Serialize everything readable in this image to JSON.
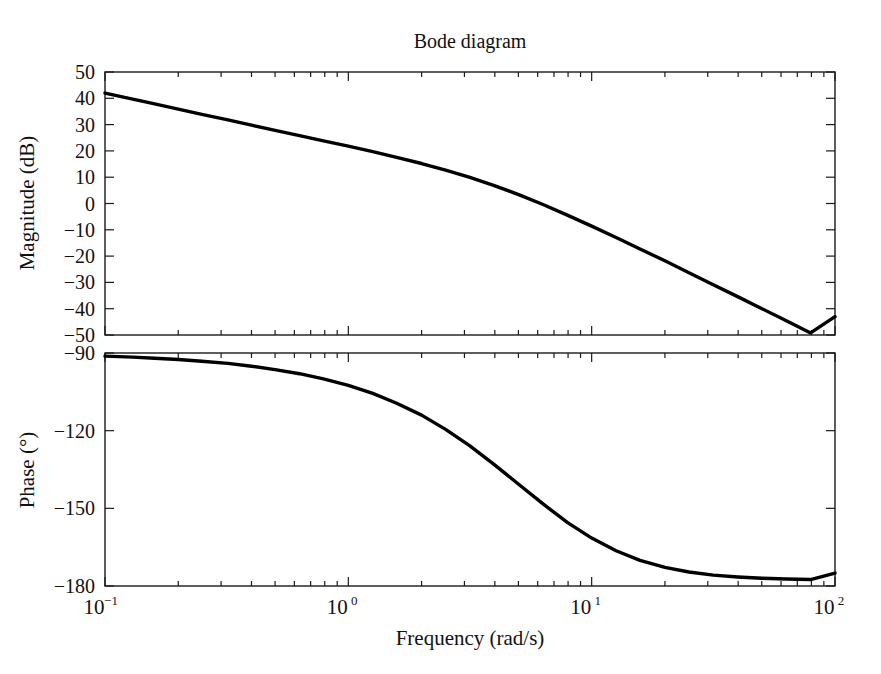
{
  "figure": {
    "title": "Bode diagram",
    "background_color": "#ffffff",
    "curve_color": "#000000",
    "axis_color": "#1a1a1a"
  },
  "xaxis": {
    "label": "Frequency (rad/s)",
    "scale": "log",
    "min": 0.1,
    "max": 100,
    "tick_values": [
      0.1,
      1,
      10,
      100
    ],
    "tick_labels": [
      "10⁻¹",
      "10⁰",
      "10¹",
      "10²"
    ],
    "tick_bases": [
      "10",
      "10",
      "10",
      "10"
    ],
    "tick_exponents": [
      "-1",
      "0",
      "1",
      "2"
    ],
    "minor_ticks_per_decade": [
      2,
      3,
      4,
      5,
      6,
      7,
      8,
      9
    ]
  },
  "panels": [
    {
      "name": "magnitude",
      "ylabel": "Magnitude (dB)",
      "ymin": -50,
      "ymax": 50,
      "ytick_values": [
        50,
        40,
        30,
        20,
        10,
        0,
        -10,
        -20,
        -30,
        -40,
        -50
      ],
      "ytick_labels": [
        "50",
        "40",
        "30",
        "20",
        "10",
        "0",
        "−10",
        "−20",
        "−30",
        "−40",
        "−50"
      ]
    },
    {
      "name": "phase",
      "ylabel": "Phase (°)",
      "ymin": -180,
      "ymax": -90,
      "ytick_values": [
        -90,
        -120,
        -150,
        -180
      ],
      "ytick_labels": [
        "−90",
        "−120",
        "−150",
        "−180"
      ]
    }
  ],
  "chart_data": {
    "type": "line",
    "title": "Bode diagram",
    "xlabel": "Frequency (rad/s)",
    "xscale": "log",
    "xlim": [
      0.1,
      100
    ],
    "grid": false,
    "legend": null,
    "subplots": [
      {
        "name": "magnitude",
        "ylabel": "Magnitude (dB)",
        "ylim": [
          -50,
          50
        ],
        "x": [
          0.1,
          0.13,
          0.16,
          0.2,
          0.25,
          0.32,
          0.4,
          0.5,
          0.63,
          0.79,
          1.0,
          1.26,
          1.58,
          2.0,
          2.51,
          3.16,
          3.98,
          5.01,
          6.31,
          7.94,
          10.0,
          12.6,
          15.8,
          20.0,
          25.1,
          31.6,
          39.8,
          50.1,
          63.1,
          79.4,
          100.0
        ],
        "y": [
          42.0,
          39.7,
          37.9,
          35.9,
          33.9,
          31.8,
          29.8,
          27.8,
          25.8,
          23.8,
          21.8,
          19.7,
          17.5,
          15.2,
          12.7,
          9.9,
          6.8,
          3.4,
          -0.4,
          -4.4,
          -8.6,
          -12.9,
          -17.3,
          -21.8,
          -26.3,
          -30.9,
          -35.4,
          -40.0,
          -44.6,
          -49.2,
          -43.0
        ]
      },
      {
        "name": "phase",
        "ylabel": "Phase (°)",
        "ylim": [
          -180,
          -90
        ],
        "x": [
          0.1,
          0.13,
          0.16,
          0.2,
          0.25,
          0.32,
          0.4,
          0.5,
          0.63,
          0.79,
          1.0,
          1.26,
          1.58,
          2.0,
          2.51,
          3.16,
          3.98,
          5.01,
          6.31,
          7.94,
          10.0,
          12.6,
          15.8,
          20.0,
          25.1,
          31.6,
          39.8,
          50.1,
          63.1,
          79.4,
          100.0
        ],
        "y": [
          -91.2,
          -91.6,
          -92.0,
          -92.5,
          -93.2,
          -94.0,
          -95.1,
          -96.4,
          -98.0,
          -100.0,
          -102.5,
          -105.6,
          -109.4,
          -114.0,
          -119.5,
          -125.9,
          -133.1,
          -140.7,
          -148.3,
          -155.4,
          -161.5,
          -166.4,
          -170.1,
          -172.8,
          -174.6,
          -175.8,
          -176.5,
          -177.0,
          -177.3,
          -177.5,
          -175.0
        ]
      }
    ]
  }
}
